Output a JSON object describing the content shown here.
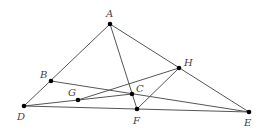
{
  "diagram": {
    "type": "geometry-figure",
    "colors": {
      "line": "#555555",
      "point": "#000000",
      "label": "#444444"
    },
    "points": [
      {
        "id": "A",
        "label": "A",
        "x": 110,
        "y": 24,
        "lx": 106,
        "ly": 17
      },
      {
        "id": "B",
        "label": "B",
        "x": 51,
        "y": 81,
        "lx": 40,
        "ly": 78
      },
      {
        "id": "C",
        "label": "C",
        "x": 132,
        "y": 94,
        "lx": 136,
        "ly": 92
      },
      {
        "id": "D",
        "label": "D",
        "x": 24,
        "y": 106,
        "lx": 17,
        "ly": 120
      },
      {
        "id": "E",
        "label": "E",
        "x": 249,
        "y": 112,
        "lx": 244,
        "ly": 126
      },
      {
        "id": "F",
        "label": "F",
        "x": 137,
        "y": 109,
        "lx": 133,
        "ly": 124
      },
      {
        "id": "G",
        "label": "G",
        "x": 78,
        "y": 100,
        "lx": 68,
        "ly": 96
      },
      {
        "id": "H",
        "label": "H",
        "x": 179,
        "y": 68,
        "lx": 184,
        "ly": 66
      }
    ],
    "segments": [
      [
        "A",
        "D"
      ],
      [
        "A",
        "F"
      ],
      [
        "A",
        "E"
      ],
      [
        "B",
        "E"
      ],
      [
        "D",
        "E"
      ],
      [
        "D",
        "C"
      ],
      [
        "G",
        "H"
      ],
      [
        "F",
        "H"
      ]
    ]
  }
}
